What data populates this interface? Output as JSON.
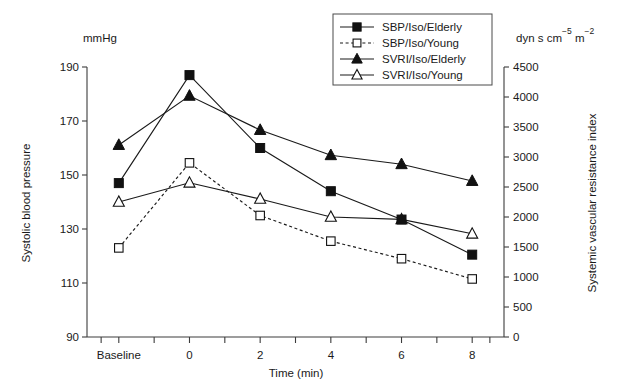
{
  "chart_data": {
    "type": "line",
    "title": "",
    "subtitle": "",
    "xlabel": "Time (min)",
    "ylabel": "Systolic blood pressure",
    "y2label": "Systemic vascular resistance index",
    "left_unit": "mmHg",
    "right_unit_parts": [
      {
        "text": "dyn s cm",
        "sup": false
      },
      {
        "text": "-5",
        "sup": true
      },
      {
        "text": " m",
        "sup": false
      },
      {
        "text": "-2",
        "sup": true
      }
    ],
    "right_unit_plain": "dyn s cm-5 m-2",
    "categories": [
      "Baseline",
      "0",
      "2",
      "4",
      "6",
      "8"
    ],
    "x_tick_labels": [
      "Baseline",
      "0",
      "2",
      "4",
      "6",
      "8"
    ],
    "x_positions": [
      0,
      1,
      2,
      3,
      4,
      5
    ],
    "xlim": [
      -0.45,
      5.45
    ],
    "ylim": [
      90,
      190
    ],
    "y_ticks": [
      90,
      110,
      130,
      150,
      170,
      190
    ],
    "y2lim": [
      0,
      4500
    ],
    "y2_ticks": [
      0,
      500,
      1000,
      1500,
      2000,
      2500,
      3000,
      3500,
      4000,
      4500
    ],
    "grid": false,
    "legend_position": "top-right",
    "minor_x_ticks": true,
    "series": [
      {
        "name": "SBP/Iso/Elderly",
        "axis": "left",
        "marker": "filled-square",
        "linestyle": "solid",
        "color": "#111111",
        "values": [
          147,
          187,
          160,
          144,
          133.5,
          120.5
        ]
      },
      {
        "name": "SBP/Iso/Young",
        "axis": "left",
        "marker": "open-square",
        "linestyle": "dashed",
        "color": "#111111",
        "values": [
          123,
          154.5,
          135,
          125.5,
          119,
          111.5
        ]
      },
      {
        "name": "SVRI/Iso/Elderly",
        "axis": "right",
        "marker": "filled-triangle",
        "linestyle": "solid",
        "color": "#111111",
        "values": [
          3200,
          4020,
          3450,
          3030,
          2880,
          2600
        ]
      },
      {
        "name": "SVRI/Iso/Young",
        "axis": "right",
        "marker": "open-triangle",
        "linestyle": "solid",
        "color": "#111111",
        "values": [
          2250,
          2570,
          2300,
          2000,
          1960,
          1720
        ]
      }
    ],
    "legend_entries": [
      {
        "label": "SBP/Iso/Elderly",
        "marker": "filled-square",
        "linestyle": "solid"
      },
      {
        "label": "SBP/Iso/Young",
        "marker": "open-square",
        "linestyle": "dashed"
      },
      {
        "label": "SVRI/Iso/Elderly",
        "marker": "filled-triangle",
        "linestyle": "solid"
      },
      {
        "label": "SVRI/Iso/Young",
        "marker": "open-triangle",
        "linestyle": "solid"
      }
    ]
  },
  "colors": {
    "ink": "#1a1a1a",
    "axis": "#3c3c3c",
    "marker": "#111111",
    "background": "#ffffff"
  }
}
